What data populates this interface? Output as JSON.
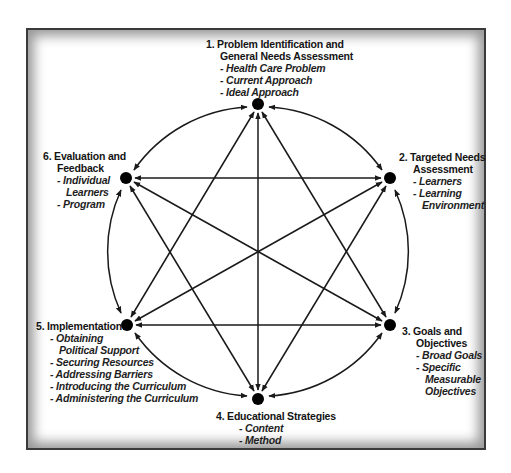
{
  "diagram": {
    "type": "six-step cycle / complete graph",
    "colors": {
      "frame": "#3a3a3a",
      "lines": "#1a1a1a",
      "nodes": "#000000",
      "text": "#141414"
    },
    "nodes": [
      {
        "id": 1,
        "x": 258,
        "y": 104
      },
      {
        "id": 2,
        "x": 390,
        "y": 178
      },
      {
        "id": 3,
        "x": 390,
        "y": 325
      },
      {
        "id": 4,
        "x": 258,
        "y": 399
      },
      {
        "id": 5,
        "x": 127,
        "y": 325
      },
      {
        "id": 6,
        "x": 126,
        "y": 178
      }
    ],
    "steps": {
      "s1": {
        "title_l1": "1. Problem Identification and",
        "title_l2": "General Needs Assessment",
        "items": [
          "- Health Care Problem",
          "- Current Approach",
          "- Ideal Approach"
        ]
      },
      "s2": {
        "title_l1": "2. Targeted Needs",
        "title_l2": "Assessment",
        "items": [
          "- Learners",
          "- Learning",
          "Environment"
        ]
      },
      "s3": {
        "title_l1": "3. Goals and",
        "title_l2": "Objectives",
        "items": [
          "- Broad Goals",
          "- Specific",
          "Measurable",
          "Objectives"
        ]
      },
      "s4": {
        "title_l1": "4. Educational Strategies",
        "items": [
          "- Content",
          "- Method"
        ]
      },
      "s5": {
        "title_l1": "5. Implementation",
        "items": [
          "- Obtaining",
          "Political Support",
          "- Securing Resources",
          "- Addressing Barriers",
          "- Introducing the Curriculum",
          "- Administering the Curriculum"
        ]
      },
      "s6": {
        "title_l1": "6. Evaluation and",
        "title_l2": "Feedback",
        "items": [
          "- Individual",
          "Learners",
          "- Program"
        ]
      }
    }
  }
}
